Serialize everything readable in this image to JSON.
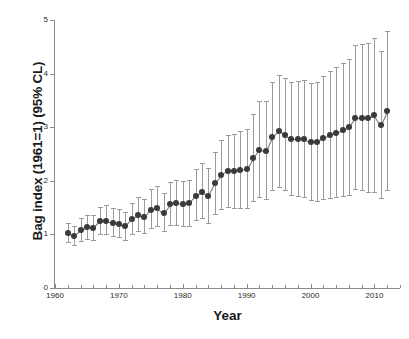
{
  "chart_data": {
    "type": "scatter",
    "title": "",
    "xlabel": "Year",
    "ylabel": "Bag index (1961=1) (95% CL)",
    "xlim": [
      1960,
      2014
    ],
    "ylim": [
      0,
      5
    ],
    "xticks": [
      1960,
      1970,
      1980,
      1990,
      2000,
      2010
    ],
    "xtick_labels": [
      "1960",
      "1970",
      "1980",
      "1990",
      "2000",
      "2010"
    ],
    "xminor_step": 2,
    "yticks": [
      0,
      1,
      2,
      3,
      4,
      5
    ],
    "ytick_labels": [
      "0",
      "1",
      "2",
      "3",
      "4",
      "5"
    ],
    "grid": false,
    "legend": null,
    "marker_color": "#3a3a3a",
    "errorbar_color": "#9a9a9a",
    "connector_color": "#6f6f6f",
    "series": [
      {
        "name": "Bag index (1961=1)",
        "error_type": "95% CL",
        "x": [
          1962,
          1963,
          1964,
          1965,
          1966,
          1967,
          1968,
          1969,
          1970,
          1971,
          1972,
          1973,
          1974,
          1975,
          1976,
          1977,
          1978,
          1979,
          1980,
          1981,
          1982,
          1983,
          1984,
          1985,
          1986,
          1987,
          1988,
          1989,
          1990,
          1991,
          1992,
          1993,
          1994,
          1995,
          1996,
          1997,
          1998,
          1999,
          2000,
          2001,
          2002,
          2003,
          2004,
          2005,
          2006,
          2007,
          2008,
          2009,
          2010,
          2011,
          2012
        ],
        "y": [
          1.03,
          0.97,
          1.08,
          1.13,
          1.12,
          1.25,
          1.25,
          1.22,
          1.2,
          1.15,
          1.28,
          1.36,
          1.32,
          1.46,
          1.5,
          1.4,
          1.56,
          1.58,
          1.57,
          1.58,
          1.72,
          1.8,
          1.72,
          1.95,
          2.1,
          2.18,
          2.18,
          2.2,
          2.22,
          2.42,
          2.58,
          2.56,
          2.82,
          2.92,
          2.86,
          2.78,
          2.78,
          2.78,
          2.72,
          2.72,
          2.8,
          2.85,
          2.9,
          2.95,
          3.0,
          3.18,
          3.18,
          3.18,
          3.22,
          3.04,
          3.3
        ],
        "y_lower": [
          0.86,
          0.8,
          0.88,
          0.92,
          0.9,
          1.0,
          1.0,
          0.97,
          0.95,
          0.9,
          1.0,
          1.06,
          1.02,
          1.12,
          1.15,
          1.06,
          1.18,
          1.18,
          1.16,
          1.16,
          1.26,
          1.3,
          1.22,
          1.38,
          1.48,
          1.52,
          1.5,
          1.5,
          1.5,
          1.62,
          1.7,
          1.66,
          1.82,
          1.88,
          1.82,
          1.74,
          1.72,
          1.7,
          1.64,
          1.62,
          1.66,
          1.68,
          1.7,
          1.72,
          1.74,
          1.84,
          1.82,
          1.8,
          1.8,
          1.68,
          1.82
        ],
        "y_upper": [
          1.22,
          1.16,
          1.3,
          1.36,
          1.36,
          1.52,
          1.54,
          1.5,
          1.48,
          1.42,
          1.58,
          1.7,
          1.66,
          1.84,
          1.9,
          1.78,
          1.98,
          2.02,
          2.0,
          2.02,
          2.22,
          2.34,
          2.24,
          2.54,
          2.76,
          2.86,
          2.88,
          2.92,
          2.96,
          3.24,
          3.48,
          3.48,
          3.84,
          3.98,
          3.92,
          3.84,
          3.86,
          3.88,
          3.82,
          3.84,
          3.96,
          4.04,
          4.12,
          4.2,
          4.28,
          4.54,
          4.56,
          4.58,
          4.66,
          4.42,
          4.8
        ]
      }
    ]
  }
}
